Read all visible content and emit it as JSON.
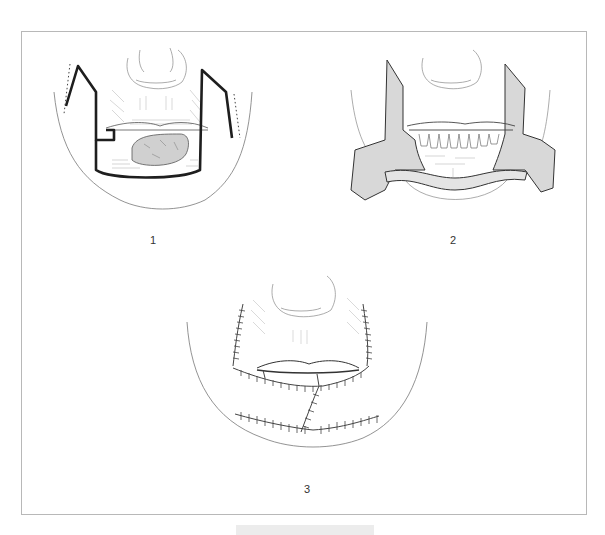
{
  "figure": {
    "panels": [
      {
        "id": 1,
        "label": "1",
        "description": "Lower lip tumor with outlined rectangular excision and bilateral cheek flap incision lines"
      },
      {
        "id": 2,
        "label": "2",
        "description": "Excision performed; bilateral flaps raised and advanced, lower teeth exposed"
      },
      {
        "id": 3,
        "label": "3",
        "description": "Flaps sutured into place with interrupted suture lines"
      }
    ],
    "caption": ""
  },
  "colors": {
    "ink": "#2a2a2a",
    "hatch": "#9a9a9a",
    "incision": "#1e1e1e",
    "frame": "#b8b8b8",
    "flap_fill": "#d8d8d8"
  }
}
